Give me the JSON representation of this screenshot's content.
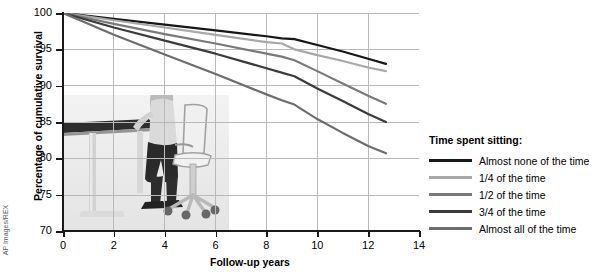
{
  "credit": {
    "text": "AP Images/REX"
  },
  "chart_data": {
    "type": "line",
    "title": "",
    "xlabel": "Follow-up years",
    "ylabel": "Percentage of cumulative survival",
    "xlim": [
      0,
      14
    ],
    "ylim": [
      70,
      100
    ],
    "xticks": [
      0,
      2,
      4,
      6,
      8,
      10,
      12,
      14
    ],
    "yticks": [
      70,
      75,
      80,
      85,
      90,
      95,
      100
    ],
    "grid": true,
    "legend_position": "right",
    "legend_title": "Time spent sitting:",
    "series": [
      {
        "name": "Almost none of the time",
        "color": "#171717",
        "x": [
          0,
          2,
          4,
          6,
          8,
          8.6,
          9.1,
          10,
          11,
          12,
          12.7
        ],
        "y": [
          100,
          99.2,
          98.4,
          97.6,
          96.8,
          96.5,
          96.4,
          95.6,
          94.7,
          93.7,
          93.0
        ]
      },
      {
        "name": "1/4 of the time",
        "color": "#a8a8a8",
        "x": [
          0,
          2,
          4,
          6,
          8,
          8.6,
          9.1,
          10,
          11,
          12,
          12.7
        ],
        "y": [
          100,
          99.0,
          98.0,
          97.0,
          96.0,
          95.8,
          95.0,
          94.2,
          93.4,
          92.5,
          92.0
        ]
      },
      {
        "name": "1/2 of the time",
        "color": "#7a7a7a",
        "x": [
          0,
          2,
          4,
          6,
          8,
          8.6,
          9.1,
          10,
          11,
          12,
          12.7
        ],
        "y": [
          100,
          98.5,
          97.1,
          95.8,
          94.4,
          94.0,
          93.5,
          92.0,
          90.3,
          88.6,
          87.5
        ]
      },
      {
        "name": "3/4 of the time",
        "color": "#3c3c3c",
        "x": [
          0,
          2,
          4,
          6,
          8,
          8.6,
          9.1,
          10,
          11,
          12,
          12.7
        ],
        "y": [
          100,
          98.0,
          96.2,
          94.4,
          92.4,
          91.8,
          91.3,
          89.6,
          87.9,
          86.1,
          85.0
        ]
      },
      {
        "name": "Almost all of the time",
        "color": "#6e6e6e",
        "x": [
          0,
          2,
          4,
          6,
          8,
          8.6,
          9.1,
          10,
          11,
          12,
          12.7
        ],
        "y": [
          100,
          97.0,
          94.3,
          91.6,
          88.8,
          88.0,
          87.4,
          85.4,
          83.5,
          81.7,
          80.7
        ]
      }
    ]
  }
}
